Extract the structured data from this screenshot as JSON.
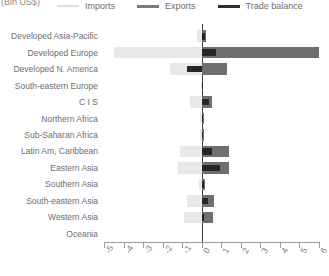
{
  "header": {
    "unit_label": "(Bln US$)"
  },
  "legend": {
    "position": "top",
    "items": [
      {
        "label": "Imports",
        "color": "#e8e8e8",
        "icon": "line-swatch-icon"
      },
      {
        "label": "Exports",
        "color": "#6f6f6f",
        "icon": "line-swatch-icon"
      },
      {
        "label": "Trade balance",
        "color": "#262626",
        "icon": "line-swatch-icon"
      }
    ]
  },
  "chart_data": {
    "type": "bar",
    "orientation": "horizontal",
    "title": "",
    "subtitle": "",
    "xlabel": "",
    "ylabel": "",
    "unit": "Bln US$",
    "xlim": [
      -5,
      6
    ],
    "xticks": [
      -5,
      -4,
      -3,
      -2,
      -1,
      0,
      1,
      2,
      3,
      4,
      5,
      6
    ],
    "xtick_labels": [
      "-5",
      "-4",
      "-3",
      "-2",
      "-1",
      "0",
      "1",
      "2",
      "3",
      "4",
      "5",
      "6"
    ],
    "grid": false,
    "zero_line": true,
    "categories": [
      "Developed Asia-Pacific",
      "Developed Europe",
      "Developed N. America",
      "South-eastern Europe",
      "C I S",
      "Northern Africa",
      "Sub-Saharan Africa",
      "Latin Am, Caribbean",
      "Eastern Asia",
      "Southern Asia",
      "South-eastern Asia",
      "Western Asia",
      "Oceania"
    ],
    "series": [
      {
        "name": "Imports",
        "color": "#e8e8e8",
        "values": [
          -0.25,
          -4.5,
          -1.6,
          -0.05,
          -0.6,
          -0.1,
          -0.1,
          -1.1,
          -1.2,
          -0.15,
          -0.75,
          -0.9,
          0.0
        ]
      },
      {
        "name": "Exports",
        "color": "#6f6f6f",
        "values": [
          0.2,
          6.0,
          1.3,
          0.05,
          0.55,
          0.1,
          0.1,
          1.4,
          1.4,
          0.15,
          0.65,
          0.6,
          0.0
        ]
      },
      {
        "name": "Trade balance",
        "color": "#262626",
        "values": [
          0.15,
          0.75,
          -0.75,
          0.02,
          0.35,
          0.05,
          0.05,
          0.55,
          0.95,
          0.1,
          0.3,
          0.1,
          0.0
        ]
      }
    ]
  }
}
